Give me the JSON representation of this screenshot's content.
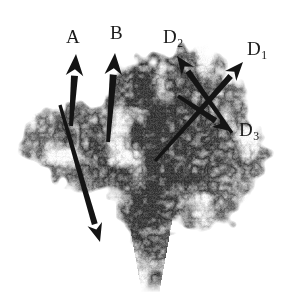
{
  "figure": {
    "width": 294,
    "height": 299,
    "background_color": "#ffffff",
    "modality": "grayscale micro-CT / radiograph",
    "specimen_tone_dark": "#4a4a4a",
    "specimen_tone_mid": "#8f8f8f",
    "specimen_tone_light": "#c9c9c9",
    "annotation_color": "#141414"
  },
  "labels": [
    {
      "id": "A",
      "text": "A",
      "base": "A",
      "sub": "",
      "x": 66,
      "y": 27
    },
    {
      "id": "B",
      "text": "B",
      "base": "B",
      "sub": "",
      "x": 110,
      "y": 23
    },
    {
      "id": "D2",
      "text": "D2",
      "base": "D",
      "sub": "2",
      "x": 163,
      "y": 27
    },
    {
      "id": "D1",
      "text": "D1",
      "base": "D",
      "sub": "1",
      "x": 247,
      "y": 39
    },
    {
      "id": "D3",
      "text": "D3",
      "base": "D",
      "sub": "3",
      "x": 239,
      "y": 120
    }
  ],
  "arrows": [
    {
      "id": "arrow-a",
      "label": "A",
      "description": "thick vertical arrow pointing up, left side",
      "tail": {
        "x": 71,
        "y": 126
      },
      "head": {
        "x": 76,
        "y": 54
      },
      "width": 7
    },
    {
      "id": "arrow-b",
      "label": "B",
      "description": "thick vertical arrow pointing up, second from left",
      "tail": {
        "x": 108,
        "y": 142
      },
      "head": {
        "x": 115,
        "y": 53
      },
      "width": 7
    },
    {
      "id": "arrow-diagonal-left",
      "label": "",
      "description": "long diagonal arrow from upper-left down to lower-right",
      "tail": {
        "x": 60,
        "y": 105
      },
      "head": {
        "x": 100,
        "y": 242
      },
      "width": 6
    },
    {
      "id": "arrow-d1",
      "label": "D1",
      "description": "diagonal arrow pointing up-right",
      "tail": {
        "x": 155,
        "y": 161
      },
      "head": {
        "x": 243,
        "y": 62
      },
      "width": 6
    },
    {
      "id": "arrow-d2",
      "label": "D2",
      "description": "diagonal arrow pointing up-left",
      "tail": {
        "x": 232,
        "y": 133
      },
      "head": {
        "x": 177,
        "y": 56
      },
      "width": 6
    },
    {
      "id": "arrow-d3",
      "label": "D3",
      "description": "short diagonal arrow pointing down-right toward D3 label",
      "tail": {
        "x": 178,
        "y": 96
      },
      "head": {
        "x": 231,
        "y": 131
      },
      "width": 6
    }
  ]
}
